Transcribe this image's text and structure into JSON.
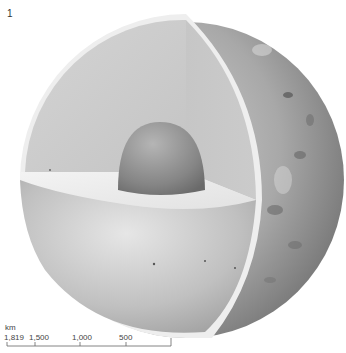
{
  "figure": {
    "number": "1"
  },
  "scale": {
    "unit": "km",
    "labels": [
      "1,819",
      "1,500",
      "1,000",
      "500"
    ],
    "tick_x": [
      7,
      35,
      80,
      126,
      171
    ]
  },
  "colors": {
    "surface_dark": "#7a7a7a",
    "surface_light": "#c8c8c8",
    "mantle_upper": "#cfcfcf",
    "mantle_face": "#c2c2c2",
    "crust_rim": "#efefef",
    "core": "#8e8e8e",
    "cut_plane": "#ececec"
  }
}
